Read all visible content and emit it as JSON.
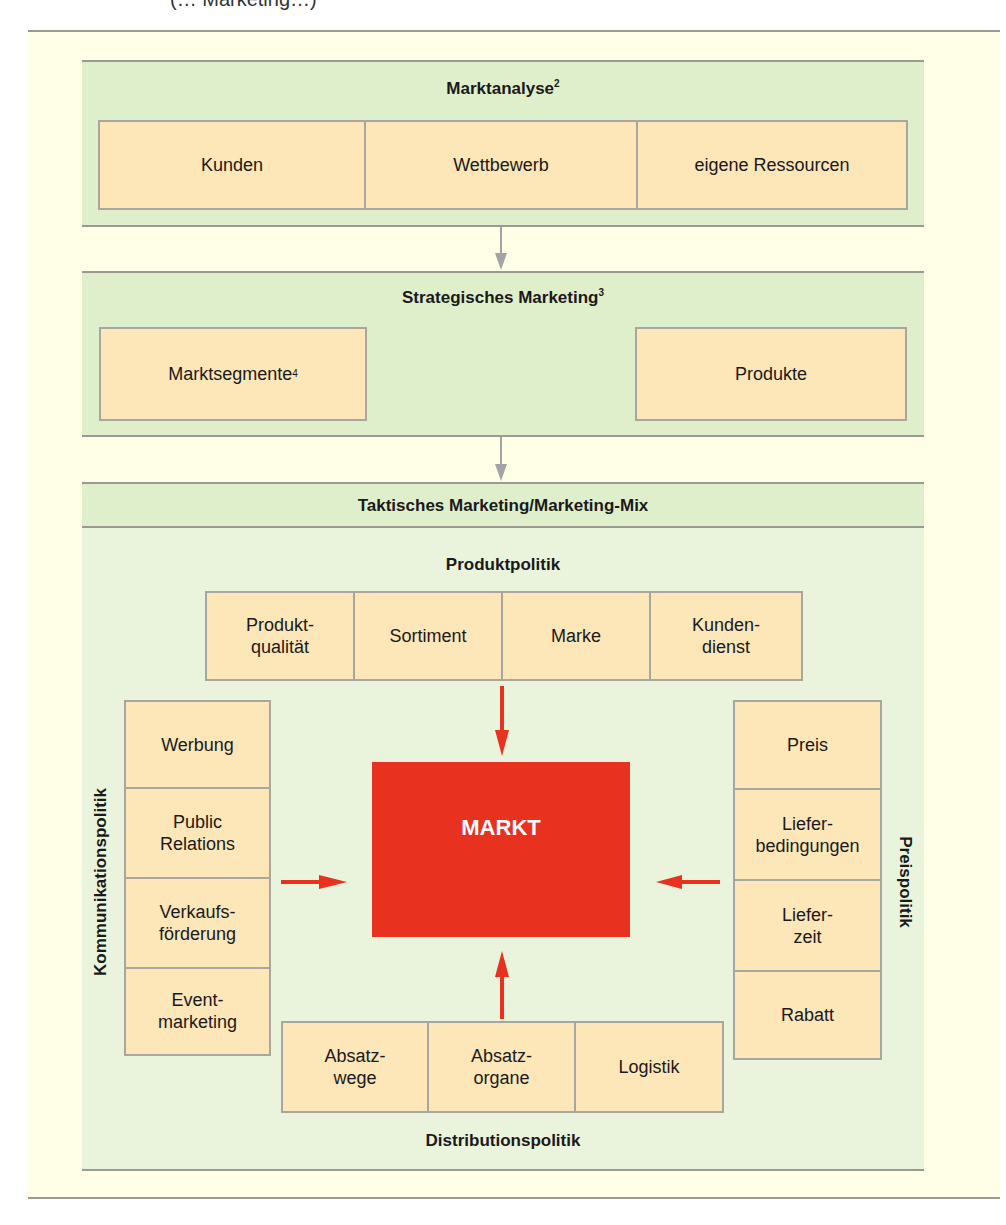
{
  "caption_partial": "(… Marketing…)",
  "colors": {
    "page_bg": "#fffee6",
    "panel_green": "#e0efcb",
    "panel_light_green": "#eaf4dc",
    "box_fill": "#fde6b8",
    "border_gray": "#9a9a92",
    "arrow_gray": "#a3a3a3",
    "markt_red": "#e8321f",
    "arrow_red": "#e8321f"
  },
  "marktanalyse": {
    "title": "Marktanalyse",
    "footnote": "2",
    "items": [
      "Kunden",
      "Wettbewerb",
      "eigene Ressourcen"
    ]
  },
  "strategisch": {
    "title": "Strategisches Marketing",
    "footnote": "3",
    "left": {
      "label": "Marktsegmente",
      "footnote": "4"
    },
    "right": {
      "label": "Produkte"
    }
  },
  "taktisch": {
    "title": "Taktisches Marketing/Marketing-Mix",
    "center": "MARKT",
    "produktpolitik": {
      "title": "Produktpolitik",
      "items": [
        "Produkt-\nqualität",
        "Sortiment",
        "Marke",
        "Kunden-\ndienst"
      ]
    },
    "kommunikationspolitik": {
      "title": "Kommunikationspolitik",
      "items": [
        "Werbung",
        "Public\nRelations",
        "Verkaufs-\nförderung",
        "Event-\nmarketing"
      ]
    },
    "preispolitik": {
      "title": "Preispolitik",
      "items": [
        "Preis",
        "Liefer-\nbedingungen",
        "Liefer-\nzeit",
        "Rabatt"
      ]
    },
    "distributionspolitik": {
      "title": "Distributionspolitik",
      "items": [
        "Absatz-\nwege",
        "Absatz-\norgane",
        "Logistik"
      ]
    }
  }
}
